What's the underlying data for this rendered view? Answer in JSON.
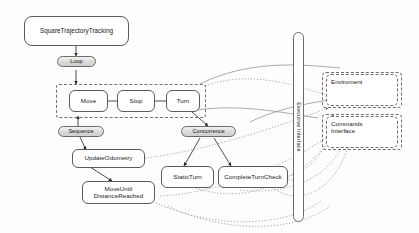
{
  "diagram": {
    "colors": {
      "background": "#fdfdfd",
      "node_border": "#5b5b5b",
      "control_fill": "#d9d9d9",
      "dashed_border": "#707070",
      "edge_solid": "#3a3a3a",
      "edge_dotted": "#9a9a9a"
    },
    "nodes": {
      "root": {
        "label": "SquareTrajectoryTracking",
        "type": "task"
      },
      "loop": {
        "label": "Loop",
        "type": "control"
      },
      "move": {
        "label": "Move",
        "type": "task"
      },
      "stop": {
        "label": "Stop",
        "type": "task"
      },
      "turn": {
        "label": "Turn",
        "type": "task"
      },
      "sequence": {
        "label": "Sequence",
        "type": "control"
      },
      "concurrence": {
        "label": "Concurrence",
        "type": "control"
      },
      "update_odometry": {
        "label": "UpdateOdometry",
        "type": "task"
      },
      "move_until_distance_reached": {
        "label_line1": "MoveUntil",
        "label_line2": "DistanceReached",
        "type": "task"
      },
      "static_turn": {
        "label": "StaticTurn",
        "type": "task"
      },
      "complete_turn_check": {
        "label": "CompleteTurnCheck",
        "type": "task"
      }
    },
    "external": {
      "executive_interface": {
        "label": "Executive Interface"
      },
      "environment": {
        "label": "Enviroment"
      },
      "commands_interface": {
        "label_line1": "Commands",
        "label_line2": "Interface"
      }
    }
  }
}
